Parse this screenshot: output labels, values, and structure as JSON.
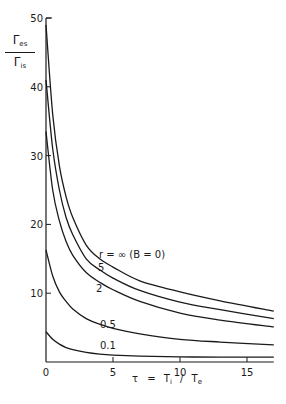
{
  "chart_data": {
    "type": "line",
    "title": "",
    "xlabel": "τ = Ti / Te",
    "xlabel_parts": {
      "tau": "τ",
      "eq": "=",
      "T": "T",
      "i": "i",
      "slash": "/",
      "e": "e"
    },
    "ylabel": "Γes / Γis",
    "ylabel_parts": {
      "num_main": "Γ",
      "num_sub": "es",
      "den_main": "Γ",
      "den_sub": "is"
    },
    "xlim": [
      0,
      17
    ],
    "ylim": [
      0,
      50
    ],
    "xticks": [
      0,
      5,
      10,
      15
    ],
    "yticks": [
      10,
      20,
      30,
      40,
      50
    ],
    "xtick_labels": [
      "0",
      "5",
      "10",
      "15"
    ],
    "ytick_labels": [
      "10",
      "20",
      "30",
      "40",
      "50"
    ],
    "grid": false,
    "legend": "inline curve labels",
    "series": [
      {
        "name": "r = ∞ (B=0)",
        "label": "r = ∞   (B = 0)",
        "x": [
          0,
          0.5,
          1,
          1.5,
          2,
          3,
          4,
          5,
          7,
          10,
          13,
          17
        ],
        "y": [
          49,
          36,
          28.5,
          24,
          21,
          17,
          15,
          13.8,
          11.8,
          10.2,
          8.9,
          7.4
        ]
      },
      {
        "name": "r = 5",
        "label": "5",
        "x": [
          0,
          0.5,
          1,
          1.5,
          2,
          3,
          4,
          5,
          7,
          10,
          13,
          17
        ],
        "y": [
          41,
          31,
          25,
          21,
          18.5,
          15,
          13.4,
          12.2,
          10.4,
          8.7,
          7.6,
          6.3
        ]
      },
      {
        "name": "r = 2",
        "label": "2",
        "x": [
          0,
          0.5,
          1,
          1.5,
          2,
          3,
          4,
          5,
          7,
          10,
          13,
          17
        ],
        "y": [
          33.5,
          25,
          20.5,
          17.5,
          15.5,
          13,
          11.6,
          10.5,
          8.8,
          7.1,
          6.1,
          5.1
        ]
      },
      {
        "name": "r = 0.5",
        "label": "0.5",
        "x": [
          0,
          0.5,
          1,
          1.5,
          2,
          3,
          4,
          5,
          7,
          10,
          13,
          17
        ],
        "y": [
          16.3,
          12.5,
          10.2,
          8.8,
          7.7,
          6.3,
          5.5,
          4.9,
          4.1,
          3.3,
          2.9,
          2.5
        ]
      },
      {
        "name": "r = 0.1",
        "label": "0.1",
        "x": [
          0,
          0.5,
          1,
          1.5,
          2,
          3,
          4,
          5,
          7,
          10,
          13,
          17
        ],
        "y": [
          4.4,
          3.3,
          2.6,
          2.1,
          1.8,
          1.4,
          1.15,
          1.0,
          0.85,
          0.75,
          0.7,
          0.7
        ]
      }
    ]
  }
}
